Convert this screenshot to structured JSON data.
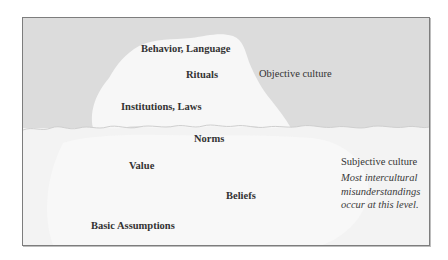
{
  "diagram": {
    "type": "iceberg",
    "colors": {
      "above_water": "#dcdcdc",
      "below_water": "#f3f3f3",
      "iceberg_tip": "#f7f7f7",
      "frame_border": "#7d7d7d",
      "text": "#333333"
    },
    "above_water": {
      "side_label": "Objective culture",
      "layers": [
        {
          "label": "Behavior, Language"
        },
        {
          "label": "Rituals"
        },
        {
          "label": "Institutions, Laws"
        }
      ]
    },
    "below_water": {
      "side_label": "Subjective culture",
      "note_lines": [
        "Most intercultural",
        "misunderstandings",
        "occur at this level."
      ],
      "layers": [
        {
          "label": "Norms"
        },
        {
          "label": "Value"
        },
        {
          "label": "Beliefs"
        },
        {
          "label": "Basic Assumptions"
        }
      ]
    }
  }
}
